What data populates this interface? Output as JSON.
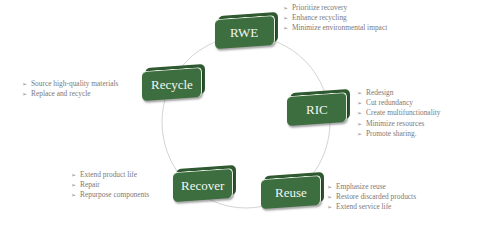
{
  "diagram": {
    "type": "circular-cycle",
    "colors": {
      "box_fill": "#3d6e3f",
      "box_shadow": "#2f5a31",
      "box_text": "#f3f6f1",
      "bullet_text": "#7a7a7a",
      "ring": "#c8c8c8"
    },
    "bullet_icon": "arrowhead-bullet-icon",
    "nodes": [
      {
        "label": "RWE",
        "bullets": [
          "Prioritize recovery",
          "Enhance recycling",
          "Minimize environmental impact"
        ]
      },
      {
        "label": "RIC",
        "bullets": [
          "Redesign",
          "Cut redundancy",
          "Create multifunctionality",
          "Minimize resources",
          "Promote sharing."
        ]
      },
      {
        "label": "Reuse",
        "bullets": [
          "Emphasize reuse",
          "Restore discarded products",
          "Extend service life"
        ]
      },
      {
        "label": "Recover",
        "bullets": [
          "Extend product life",
          "Repair",
          "Repurpose components"
        ]
      },
      {
        "label": "Recycle",
        "bullets": [
          "Source high-quality materials",
          "Replace and recycle"
        ]
      }
    ]
  }
}
